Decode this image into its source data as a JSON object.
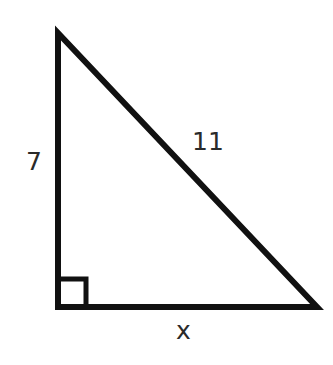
{
  "diagram": {
    "type": "right-triangle",
    "stroke_color": "#111111",
    "label_color": "#2a2a2a",
    "vertices": {
      "top": [
        58,
        33
      ],
      "bottom_left": [
        58,
        307
      ],
      "bottom_right": [
        317,
        307
      ]
    },
    "right_angle_marker": "bottom-left",
    "labels": {
      "vertical_leg": "7",
      "hypotenuse": "11",
      "base_leg": "x"
    }
  }
}
